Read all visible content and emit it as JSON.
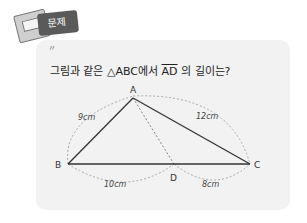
{
  "badge": {
    "label": "문제"
  },
  "question": {
    "prefix": "그림과 같은 △ABC에서 ",
    "segment": "AD",
    "suffix": " 의 길이는?"
  },
  "figure": {
    "vertices": {
      "A": "A",
      "B": "B",
      "C": "C",
      "D": "D"
    },
    "lengths": {
      "AB": "9cm",
      "AC": "12cm",
      "BD": "10cm",
      "DC": "8cm"
    }
  }
}
